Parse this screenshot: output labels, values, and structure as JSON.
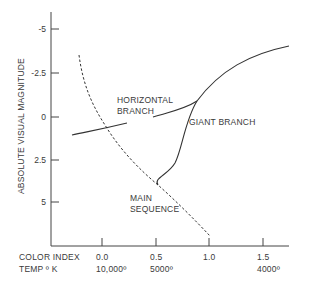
{
  "diagram": {
    "type": "hr-diagram",
    "y_axis": {
      "label": "ABSOLUTE VISUAL MAGNITUDE",
      "ticks": [
        "-5",
        "-2.5",
        "0",
        "2.5",
        "5"
      ]
    },
    "x_axis": {
      "row1_label": "COLOR INDEX",
      "row2_label": "TEMP º K",
      "color_index_ticks": [
        "0.0",
        "0.5",
        "1.0",
        "1.5"
      ],
      "temp_ticks": [
        "10,000º",
        "5000º",
        "4000º"
      ]
    },
    "annotations": {
      "horizontal_branch": [
        "HORIZONTAL",
        "BRANCH"
      ],
      "giant_branch": "GIANT BRANCH",
      "main_sequence": [
        "MAIN",
        "SEQUENCE"
      ]
    },
    "line_color": "#333333"
  }
}
